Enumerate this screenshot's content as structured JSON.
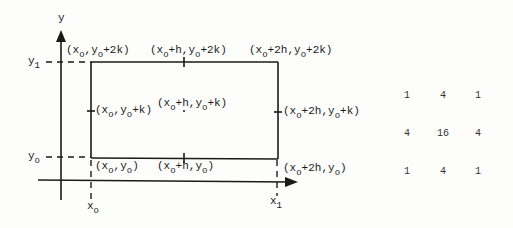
{
  "axes": {
    "x_label": "x",
    "y_label": "y"
  },
  "axis_marks": {
    "y1": {
      "base": "y",
      "sub": "1"
    },
    "y0": {
      "base": "y",
      "sub": "o"
    },
    "x0": {
      "base": "x",
      "sub": "o"
    },
    "x1": {
      "base": "x",
      "sub": "1"
    }
  },
  "points": {
    "top_left": {
      "parts": [
        "(x",
        "o",
        ",y",
        "o",
        "+2k)"
      ]
    },
    "top_mid": {
      "parts": [
        "(x",
        "o",
        "+h,y",
        "o",
        "+2k)"
      ]
    },
    "top_right": {
      "parts": [
        "(x",
        "o",
        "+2h,y",
        "o",
        "+2k)"
      ]
    },
    "mid_left": {
      "parts": [
        "(x",
        "o",
        ",y",
        "o",
        "+k)"
      ]
    },
    "center": {
      "parts": [
        "(x",
        "o",
        "+h,y",
        "o",
        "+k)"
      ]
    },
    "mid_right": {
      "parts": [
        "(x",
        "o",
        "+2h,y",
        "o",
        "+k)"
      ]
    },
    "bot_left": {
      "parts": [
        "(x",
        "o",
        ",y",
        "o",
        ")"
      ]
    },
    "bot_mid": {
      "parts": [
        "(x",
        "o",
        "+h,y",
        "o",
        ")"
      ]
    },
    "bot_right": {
      "parts": [
        "(x",
        "o",
        "+2h,y",
        "o",
        ")"
      ]
    }
  },
  "weights": [
    [
      "1",
      "4",
      "1"
    ],
    [
      "4",
      "16",
      "4"
    ],
    [
      "1",
      "4",
      "1"
    ]
  ]
}
